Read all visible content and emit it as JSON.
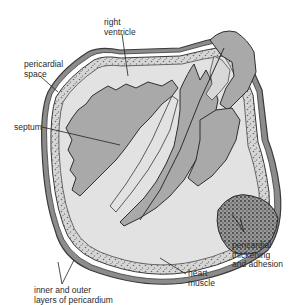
{
  "diagram": {
    "labels": {
      "right_ventricle": "right\nventricle",
      "pericardial_space": "pericardial\nspace",
      "septum": "septum",
      "pericardial_thickening": "pericardial\nthickening\nand adhesion",
      "heart_muscle": "heart\nmuscle",
      "pericardium_layers": "inner and outer\nlayers of pericardium"
    },
    "colors": {
      "chamber_gray": "#a9a9a9",
      "muscle_light": "#e2e2e2",
      "outline": "#3a3a3a",
      "stipple": "#8a8a8a",
      "background": "#ffffff"
    }
  }
}
